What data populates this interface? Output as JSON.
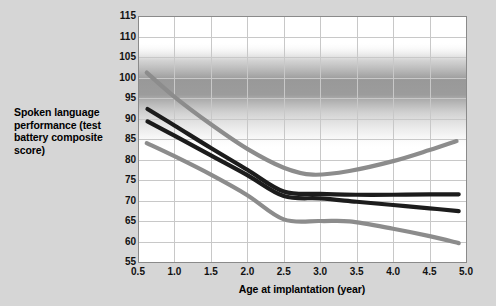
{
  "chart_data": {
    "type": "line",
    "title": "",
    "xlabel": "Age at implantation (year)",
    "ylabel": "Spoken language performance (test battery composite score)",
    "xlim": [
      0.5,
      5.0
    ],
    "ylim": [
      55,
      115
    ],
    "grid": true,
    "legend_position": "none",
    "xticks": [
      "0.5",
      "1.0",
      "1.5",
      "2.0",
      "2.5",
      "3.0",
      "3.5",
      "4.0",
      "4.5",
      "5.0"
    ],
    "yticks": [
      "55",
      "60",
      "65",
      "70",
      "75",
      "80",
      "85",
      "90",
      "95",
      "100",
      "105",
      "110",
      "115"
    ],
    "series": [
      {
        "name": "upper-confidence-band",
        "color": "#8c8c8c",
        "x": [
          0.62,
          1.0,
          1.5,
          2.0,
          2.5,
          2.9,
          3.4,
          4.0,
          4.5,
          4.87
        ],
        "values": [
          101.2,
          95.3,
          88.6,
          82.6,
          78.0,
          76.3,
          77.2,
          79.6,
          82.3,
          84.5
        ]
      },
      {
        "name": "fitted-curve-upper",
        "color": "#1c1c1c",
        "x": [
          0.63,
          1.0,
          1.5,
          2.0,
          2.5,
          3.0,
          3.5,
          4.0,
          4.5,
          4.9
        ],
        "values": [
          92.3,
          88.3,
          82.8,
          77.5,
          72.2,
          71.6,
          71.4,
          71.4,
          71.5,
          71.5
        ]
      },
      {
        "name": "fitted-curve-lower",
        "color": "#1c1c1c",
        "x": [
          0.63,
          1.0,
          1.5,
          2.0,
          2.5,
          3.0,
          3.5,
          4.0,
          4.5,
          4.9
        ],
        "values": [
          89.3,
          85.8,
          81.0,
          76.2,
          71.1,
          70.5,
          69.7,
          68.9,
          68.1,
          67.4
        ]
      },
      {
        "name": "lower-confidence-band",
        "color": "#8c8c8c",
        "x": [
          0.62,
          1.0,
          1.5,
          2.0,
          2.5,
          3.0,
          3.4,
          4.0,
          4.5,
          4.9
        ],
        "values": [
          84.0,
          80.8,
          76.3,
          71.3,
          65.4,
          65.0,
          64.9,
          63.1,
          61.3,
          59.6
        ]
      }
    ],
    "background_band": {
      "note": "vertical gradient shading across plot area, darkest near y=100",
      "top_value": 112,
      "dark_center_value": 101,
      "bottom_value": 84
    }
  },
  "colors": {
    "page_background": "#d6d6d6",
    "plot_background": "#ffffff",
    "gridline": "#c8c8c8",
    "axis_line": "#7d7d7d",
    "curve_dark": "#1c1c1c",
    "curve_gray": "#8c8c8c",
    "text": "#000000"
  }
}
